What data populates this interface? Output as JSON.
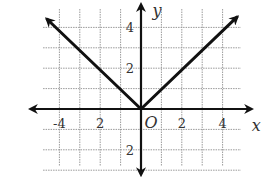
{
  "chart_data": {
    "type": "line",
    "title": "",
    "function": "y = |x|",
    "xlabel": "x",
    "ylabel": "y",
    "origin_label": "O",
    "xlim": [
      -4.8,
      5.2
    ],
    "ylim": [
      -3.2,
      5.2
    ],
    "grid": true,
    "grid_style": "dotted",
    "x_ticks": [
      {
        "value": -4,
        "label": "-4"
      },
      {
        "value": -2,
        "label": "2"
      },
      {
        "value": 2,
        "label": "2"
      },
      {
        "value": 4,
        "label": "4"
      }
    ],
    "y_ticks": [
      {
        "value": 4,
        "label": "4"
      },
      {
        "value": 2,
        "label": "2"
      },
      {
        "value": -2,
        "label": "2"
      }
    ],
    "series": [
      {
        "name": "left branch",
        "x": [
          0,
          -4.6
        ],
        "y": [
          0,
          4.4
        ],
        "arrow_end": true
      },
      {
        "name": "right branch",
        "x": [
          0,
          4.7
        ],
        "y": [
          0,
          4.5
        ],
        "arrow_end": true
      }
    ]
  },
  "geometry": {
    "origin_px": [
      141,
      109
    ],
    "unit_px": 20.4,
    "grid_x_units": [
      -4,
      -3,
      -2,
      -1,
      1,
      2,
      3,
      4
    ],
    "grid_y_units": [
      -3,
      -2,
      -1,
      1,
      2,
      3,
      4
    ],
    "grid_left_units": -4.8,
    "grid_right_units": 4.9,
    "grid_top_units": 4.9,
    "grid_bottom_units": -2.8,
    "x_axis_range_units": [
      -5.4,
      5.4
    ],
    "y_axis_range_units": [
      -3.2,
      5.1
    ]
  },
  "colors": {
    "line": "#111111",
    "grid": "#9a9a9a",
    "text": "#333333"
  }
}
